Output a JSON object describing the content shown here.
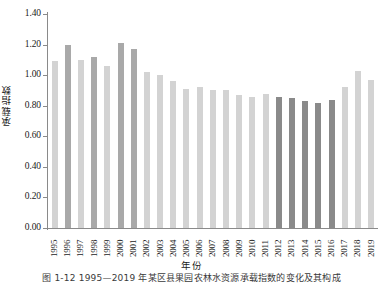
{
  "chart_data": {
    "type": "bar",
    "title": "",
    "xlabel": "年份",
    "ylabel": "承载指数",
    "ylim": [
      0.0,
      1.4
    ],
    "ytick_labels": [
      "0.00",
      "0.20",
      "0.40",
      "0.60",
      "0.80",
      "1.00",
      "1.20",
      "1.40"
    ],
    "ytick_values": [
      0.0,
      0.2,
      0.4,
      0.6,
      0.8,
      1.0,
      1.2,
      1.4
    ],
    "grid": false,
    "legend": "none",
    "categories": [
      "1995",
      "1996",
      "1997",
      "1998",
      "1999",
      "2000",
      "2001",
      "2002",
      "2003",
      "2004",
      "2005",
      "2006",
      "2007",
      "2008",
      "2009",
      "2010",
      "2011",
      "2012",
      "2013",
      "2014",
      "2015",
      "2016",
      "2017",
      "2018",
      "2019"
    ],
    "values": [
      1.09,
      1.2,
      1.1,
      1.12,
      1.06,
      1.21,
      1.17,
      1.02,
      1.0,
      0.96,
      0.91,
      0.92,
      0.9,
      0.9,
      0.87,
      0.86,
      0.88,
      0.86,
      0.85,
      0.83,
      0.82,
      0.84,
      0.92,
      1.03,
      0.97
    ],
    "bar_colors": [
      "#d3d3d3",
      "#a9a9a9",
      "#d3d3d3",
      "#a9a9a9",
      "#d3d3d3",
      "#a9a9a9",
      "#a9a9a9",
      "#d3d3d3",
      "#d3d3d3",
      "#d3d3d3",
      "#d3d3d3",
      "#d3d3d3",
      "#d3d3d3",
      "#d3d3d3",
      "#d3d3d3",
      "#d3d3d3",
      "#d3d3d3",
      "#8a8a8a",
      "#8a8a8a",
      "#8a8a8a",
      "#8a8a8a",
      "#8a8a8a",
      "#d3d3d3",
      "#d3d3d3",
      "#d3d3d3"
    ],
    "series": [
      {
        "name": "承载指数",
        "values": [
          1.09,
          1.2,
          1.1,
          1.12,
          1.06,
          1.21,
          1.17,
          1.02,
          1.0,
          0.96,
          0.91,
          0.92,
          0.9,
          0.9,
          0.87,
          0.86,
          0.88,
          0.86,
          0.85,
          0.83,
          0.82,
          0.84,
          0.92,
          1.03,
          0.97
        ]
      }
    ],
    "colors": {
      "bar_light": "#d3d3d3",
      "bar_medium": "#a9a9a9",
      "bar_dark": "#8a8a8a",
      "axis": "#8a8a8a",
      "text": "#1a1a1a"
    }
  },
  "caption": "图 1-12   1995—2019 年某区县果园农林水资源承载指数的变化及其构成"
}
